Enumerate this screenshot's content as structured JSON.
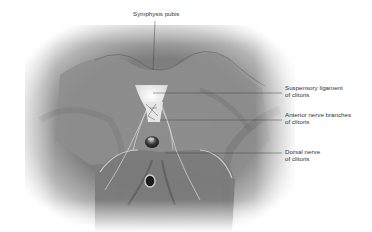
{
  "figure": {
    "colors": {
      "background": "#ffffff",
      "shading": "#7a7a7a",
      "leader_line": "#444444",
      "text": "#333333"
    }
  },
  "labels": [
    {
      "id": "symphysis-pubis",
      "lines": [
        "Symphysis pubis"
      ]
    },
    {
      "id": "suspensory-ligament",
      "lines": [
        "Suspensory ligament",
        "of clitoris"
      ]
    },
    {
      "id": "anterior-nerve-branches",
      "lines": [
        "Anterior nerve branches",
        "of clitoris"
      ]
    },
    {
      "id": "dorsal-nerve",
      "lines": [
        "Dorsal nerve",
        "of clitoris"
      ]
    }
  ]
}
